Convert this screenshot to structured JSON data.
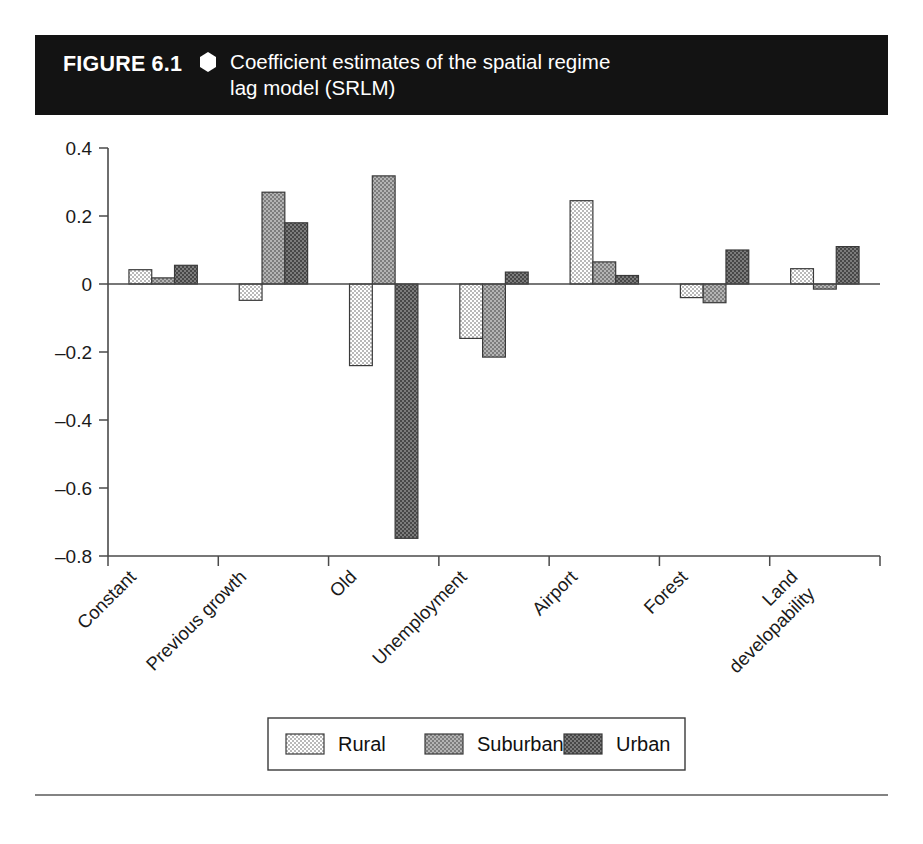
{
  "figure": {
    "number_label": "FIGURE 6.1",
    "diamond_icon": "hexagon-bullet-icon",
    "title_line1": "Coefficient estimates of the spatial regime",
    "title_line2": "lag model (SRLM)",
    "header_bg": "#131313",
    "header_fg": "#ffffff"
  },
  "chart_data": {
    "type": "bar",
    "title": "Coefficient estimates of the spatial regime lag model (SRLM)",
    "xlabel": "",
    "ylabel": "",
    "ylim": [
      -0.8,
      0.4
    ],
    "yticks": [
      0.4,
      0.2,
      0,
      -0.2,
      -0.4,
      -0.6,
      -0.8
    ],
    "ytick_labels": [
      "0.4",
      "0.2",
      "0",
      "–0.2",
      "–0.4",
      "–0.6",
      "–0.8"
    ],
    "grid": false,
    "legend_position": "bottom",
    "categories": [
      "Constant",
      "Previous growth",
      "Old",
      "Unemployment",
      "Airport",
      "Forest",
      "Land developability"
    ],
    "category_label_lines": [
      [
        "Constant"
      ],
      [
        "Previous growth"
      ],
      [
        "Old"
      ],
      [
        "Unemployment"
      ],
      [
        "Airport"
      ],
      [
        "Forest"
      ],
      [
        "Land",
        "developability"
      ]
    ],
    "series": [
      {
        "name": "Rural",
        "color": "#d2d2d2",
        "values": [
          0.042,
          -0.048,
          -0.24,
          -0.16,
          0.245,
          -0.04,
          0.045
        ]
      },
      {
        "name": "Suburban",
        "color": "#9a9a9a",
        "values": [
          0.018,
          0.27,
          0.318,
          -0.215,
          0.065,
          -0.055,
          -0.015
        ]
      },
      {
        "name": "Urban",
        "color": "#5e5e5e",
        "values": [
          0.055,
          0.18,
          -0.748,
          0.035,
          0.025,
          0.1,
          0.11
        ]
      }
    ]
  },
  "legend": {
    "items": [
      {
        "label": "Rural"
      },
      {
        "label": "Suburban"
      },
      {
        "label": "Urban"
      }
    ]
  }
}
